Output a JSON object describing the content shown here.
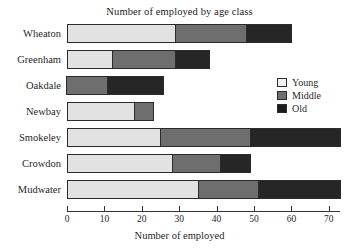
{
  "chart_data": {
    "type": "bar",
    "orientation": "horizontal",
    "stacked": true,
    "title": "Number of employed by age class",
    "xlabel": "Number of employed",
    "ylabel": "",
    "xlim": [
      0,
      73
    ],
    "xticks": [
      0,
      10,
      20,
      30,
      40,
      50,
      60,
      70
    ],
    "xticklabels": [
      "0",
      "10",
      "20",
      "30",
      "40",
      "50",
      "60",
      "70"
    ],
    "grid": false,
    "legend_position": "right",
    "categories": [
      "Wheaton",
      "Greenham",
      "Oakdale",
      "Newbay",
      "Smokeley",
      "Crowdon",
      "Mudwater"
    ],
    "series": [
      {
        "name": "Young",
        "color": "#e2e2e2",
        "values": [
          29,
          12,
          0,
          18,
          25,
          28,
          35
        ]
      },
      {
        "name": "Middle",
        "color": "#6e6e6e",
        "values": [
          19,
          17,
          11,
          5,
          24,
          13,
          16
        ]
      },
      {
        "name": "Old",
        "color": "#262626",
        "values": [
          12,
          9,
          15,
          0,
          24,
          8,
          22
        ]
      }
    ],
    "totals": [
      60,
      38,
      26,
      23,
      73,
      49,
      73
    ]
  },
  "legend": {
    "items": [
      {
        "label": "Young",
        "swatch": "young"
      },
      {
        "label": "Middle",
        "swatch": "middle"
      },
      {
        "label": "Old",
        "swatch": "old"
      }
    ]
  }
}
